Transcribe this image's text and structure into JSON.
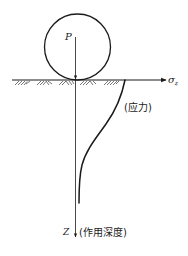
{
  "diagram": {
    "load_label": "P",
    "horizontal_axis": {
      "symbol": "σ",
      "subscript": "z"
    },
    "stress_curve_label": "(应力)",
    "vertical_axis": {
      "symbol": "Z",
      "description": "(作用深度)"
    },
    "colors": {
      "stroke": "#1a1a1a",
      "background": "#ffffff"
    }
  }
}
